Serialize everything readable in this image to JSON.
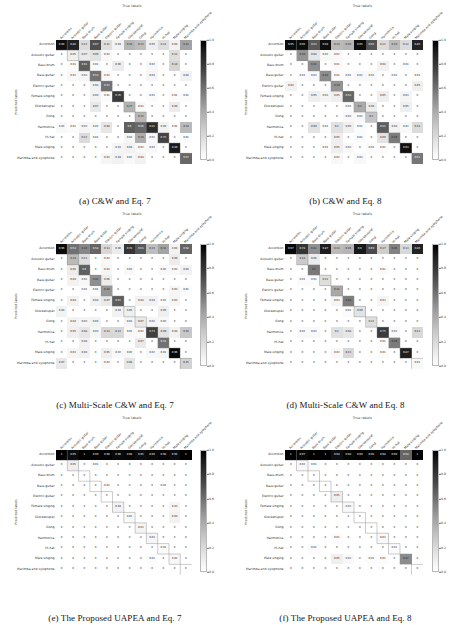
{
  "figure": {
    "axis_titles": {
      "x": "True labels",
      "y": "Predicted labels"
    },
    "classes": [
      "Accordion",
      "Acoustic guitar",
      "Bass drum",
      "Bass guitar",
      "Electric guitar",
      "Female singing",
      "Glockenspiel",
      "Gong",
      "Harmonica",
      "Hi-hat",
      "Male singing",
      "Marimba and xylophone"
    ],
    "colorbar": {
      "ticks": [
        "1.0",
        "0.8",
        "0.6",
        "0.4",
        "0.2",
        "0.0"
      ],
      "min": 0.0,
      "max": 1.0,
      "colormap": "greys"
    },
    "panels": [
      {
        "tag": "(a)",
        "caption": "(a) C&W and Eq. 7"
      },
      {
        "tag": "(b)",
        "caption": "(b) C&W and Eq. 8"
      },
      {
        "tag": "(c)",
        "caption": "(c) Multi-Scale C&W and Eq. 7"
      },
      {
        "tag": "(d)",
        "caption": "(d) Multi-Scale C&W and Eq. 8"
      },
      {
        "tag": "(e)",
        "caption": "(e) The Proposed UAPEA and Eq. 7"
      },
      {
        "tag": "(f)",
        "caption": "(f) The Proposed UAPEA and Eq. 8"
      }
    ]
  },
  "chart_data": [
    {
      "type": "heatmap",
      "title": "(a) C&W and Eq. 7",
      "xlabel": "True labels",
      "ylabel": "Predicted labels",
      "categories": [
        "Accordion",
        "Acoustic guitar",
        "Bass drum",
        "Bass guitar",
        "Electric guitar",
        "Female singing",
        "Glockenspiel",
        "Gong",
        "Harmonica",
        "Hi-hat",
        "Male singing",
        "Marimba and xylophone"
      ],
      "zlim": [
        0.0,
        1.0
      ],
      "values": [
        [
          0.94,
          0.86,
          0.12,
          0.67,
          0.11,
          0.04,
          0.26,
          0.23,
          0.05,
          0.11,
          0.04,
          0.33
        ],
        [
          0.0,
          0.05,
          0.07,
          0.09,
          0.02,
          0.0,
          0.0,
          0.0,
          0.0,
          0.0,
          0.11,
          0.0
        ],
        [
          0.0,
          0.01,
          0.61,
          0.01,
          0.0,
          0.06,
          0.0,
          0.0,
          0.02,
          0.0,
          0.14,
          0.0
        ],
        [
          0.0,
          0.02,
          0.03,
          0.53,
          0.02,
          0.0,
          0.0,
          0.0,
          0.03,
          0.0,
          0.0,
          0.04
        ],
        [
          0.0,
          0.0,
          0.0,
          0.04,
          0.53,
          0.0,
          0.0,
          0.0,
          0.0,
          0.0,
          0.0,
          0.0
        ],
        [
          0.0,
          0.0,
          0.0,
          0.04,
          0.01,
          0.76,
          0.0,
          0.0,
          0.01,
          0.0,
          0.01,
          0.01
        ],
        [
          0.0,
          0.0,
          0.0,
          0.07,
          0.0,
          0.0,
          0.27,
          0.02,
          0.0,
          0.0,
          0.06,
          0.0
        ],
        [
          0.0,
          0.0,
          0.0,
          0.0,
          0.0,
          0.0,
          0.0,
          0.25,
          0.0,
          0.0,
          0.0,
          0.0
        ],
        [
          0.02,
          0.01,
          0.03,
          0.02,
          0.08,
          0.0,
          0.6,
          0.56,
          0.81,
          0.04,
          0.01,
          0.24
        ],
        [
          0.0,
          0.0,
          0.12,
          0.01,
          0.0,
          0.0,
          0.03,
          0.29,
          0.02,
          0.72,
          0.0,
          0.01
        ],
        [
          0.0,
          0.0,
          0.0,
          0.0,
          0.0,
          0.03,
          0.04,
          0.02,
          0.02,
          0.0,
          0.89,
          0.0
        ],
        [
          0.0,
          0.0,
          0.0,
          0.0,
          0.03,
          0.04,
          0.02,
          0.04,
          0.0,
          0.0,
          0.0,
          0.57
        ]
      ]
    },
    {
      "type": "heatmap",
      "title": "(b) C&W and Eq. 8",
      "xlabel": "True labels",
      "ylabel": "Predicted labels",
      "categories": [
        "Accordion",
        "Acoustic guitar",
        "Bass drum",
        "Bass guitar",
        "Electric guitar",
        "Female singing",
        "Glockenspiel",
        "Gong",
        "Harmonica",
        "Hi-hat",
        "Male singing",
        "Marimba and xylophone"
      ],
      "zlim": [
        0.0,
        1.0
      ],
      "values": [
        [
          0.95,
          0.95,
          0.63,
          0.94,
          0.24,
          0.26,
          0.95,
          0.65,
          0.12,
          0.24,
          0.12,
          0.85
        ],
        [
          0.0,
          0.39,
          0.08,
          0.02,
          0.02,
          0.0,
          0.0,
          0.0,
          0.0,
          0.0,
          0.0,
          0.0
        ],
        [
          0.0,
          0.0,
          0.41,
          0.0,
          0.01,
          0.0,
          0.0,
          0.0,
          0.04,
          0.0,
          0.01,
          0.0
        ],
        [
          0.0,
          0.01,
          0.02,
          0.42,
          0.01,
          0.01,
          0.02,
          0.02,
          0.0,
          0.01,
          0.0,
          0.01
        ],
        [
          0.04,
          0.0,
          0.0,
          0.0,
          0.39,
          0.0,
          0.0,
          0.0,
          0.0,
          0.0,
          0.0,
          0.05
        ],
        [
          0.0,
          0.0,
          0.05,
          0.03,
          0.05,
          0.58,
          0.0,
          0.0,
          0.05,
          0.0,
          0.03,
          0.0
        ],
        [
          0.0,
          0.0,
          0.0,
          0.0,
          0.0,
          0.01,
          0.3,
          0.06,
          0.0,
          0.0,
          0.05,
          0.0
        ],
        [
          0.0,
          0.0,
          0.0,
          0.0,
          0.0,
          0.02,
          0.02,
          0.2,
          0.0,
          0.0,
          0.0,
          0.0
        ],
        [
          0.0,
          0.0,
          0.09,
          0.01,
          0.1,
          0.05,
          0.01,
          0.0,
          0.61,
          0.04,
          0.02,
          0.12
        ],
        [
          0.0,
          0.0,
          0.0,
          0.0,
          0.05,
          0.0,
          0.01,
          0.0,
          0.09,
          0.49,
          0.0,
          0.0
        ],
        [
          0.0,
          0.0,
          0.0,
          0.01,
          0.05,
          0.02,
          0.0,
          0.01,
          0.01,
          0.0,
          0.93,
          0.0
        ],
        [
          0.0,
          0.0,
          0.0,
          0.0,
          0.02,
          0.0,
          0.02,
          0.0,
          0.0,
          0.0,
          0.0,
          0.51
        ]
      ]
    },
    {
      "type": "heatmap",
      "title": "(c) Multi-Scale C&W and Eq. 7",
      "xlabel": "True labels",
      "ylabel": "Predicted labels",
      "categories": [
        "Accordion",
        "Acoustic guitar",
        "Bass drum",
        "Bass guitar",
        "Electric guitar",
        "Female singing",
        "Glockenspiel",
        "Gong",
        "Harmonica",
        "Hi-hat",
        "Male singing",
        "Marimba and xylophone"
      ],
      "zlim": [
        0.0,
        1.0
      ],
      "values": [
        [
          0.96,
          0.53,
          0.44,
          0.58,
          0.13,
          0.06,
          0.78,
          0.63,
          0.23,
          0.33,
          0.04,
          0.58
        ],
        [
          0.0,
          0.24,
          0.11,
          0.0,
          0.02,
          0.0,
          0.0,
          0.0,
          0.0,
          0.0,
          0.06,
          0.0
        ],
        [
          0.0,
          0.06,
          0.6,
          0.0,
          0.03,
          0.0,
          0.02,
          0.0,
          0.0,
          0.02,
          0.02,
          0.04
        ],
        [
          0.0,
          0.04,
          0.02,
          0.41,
          0.06,
          0.0,
          0.0,
          0.0,
          0.0,
          0.0,
          0.0,
          0.0
        ],
        [
          0.0,
          0.0,
          0.01,
          0.01,
          0.38,
          0.0,
          0.0,
          0.0,
          0.0,
          0.0,
          0.03,
          0.01
        ],
        [
          0.0,
          0.04,
          0.0,
          0.04,
          0.07,
          0.61,
          0.0,
          0.04,
          0.04,
          0.01,
          0.03,
          0.0
        ],
        [
          0.04,
          0.0,
          0.0,
          0.0,
          0.0,
          0.04,
          0.05,
          0.0,
          0.0,
          0.05,
          0.0,
          0.0
        ],
        [
          0.0,
          0.04,
          0.03,
          0.04,
          0.0,
          0.0,
          0.03,
          0.07,
          0.03,
          0.02,
          0.0,
          0.0
        ],
        [
          0.0,
          0.05,
          0.08,
          0.03,
          0.13,
          0.13,
          0.02,
          0.02,
          0.73,
          0.09,
          0.04,
          0.19
        ],
        [
          0.0,
          0.0,
          0.04,
          0.0,
          0.0,
          0.0,
          0.0,
          0.07,
          0.0,
          0.53,
          0.0,
          0.0
        ],
        [
          0.0,
          0.03,
          0.04,
          0.0,
          0.05,
          0.02,
          0.02,
          0.0,
          0.02,
          0.03,
          0.96,
          0.0
        ],
        [
          0.07,
          0.0,
          0.0,
          0.0,
          0.02,
          0.0,
          0.08,
          0.0,
          0.0,
          0.0,
          0.0,
          0.15
        ]
      ]
    },
    {
      "type": "heatmap",
      "title": "(d) Multi-Scale C&W and Eq. 8",
      "xlabel": "True labels",
      "ylabel": "Predicted labels",
      "categories": [
        "Accordion",
        "Acoustic guitar",
        "Bass drum",
        "Bass guitar",
        "Electric guitar",
        "Female singing",
        "Glockenspiel",
        "Gong",
        "Harmonica",
        "Hi-hat",
        "Male singing",
        "Marimba and xylophone"
      ],
      "zlim": [
        0.0,
        1.0
      ],
      "values": [
        [
          0.97,
          0.78,
          0.41,
          0.87,
          0.24,
          0.26,
          0.9,
          0.69,
          0.17,
          0.46,
          0.13,
          0.85
        ],
        [
          0.0,
          0.18,
          0.06,
          0.0,
          0.0,
          0.0,
          0.0,
          0.0,
          0.0,
          0.0,
          0.0,
          0.0
        ],
        [
          0.0,
          0.0,
          0.5,
          0.0,
          0.0,
          0.0,
          0.0,
          0.0,
          0.01,
          0.0,
          0.0,
          0.0
        ],
        [
          0.0,
          0.01,
          0.01,
          0.11,
          0.0,
          0.0,
          0.0,
          0.0,
          0.0,
          0.0,
          0.0,
          0.0
        ],
        [
          0.0,
          0.0,
          0.0,
          0.0,
          0.31,
          0.0,
          0.0,
          0.0,
          0.0,
          0.0,
          0.0,
          0.0
        ],
        [
          0.0,
          0.0,
          0.0,
          0.0,
          0.03,
          0.48,
          0.0,
          0.0,
          0.03,
          0.0,
          0.0,
          0.0
        ],
        [
          0.0,
          0.0,
          0.0,
          0.0,
          0.0,
          0.01,
          0.09,
          0.0,
          0.0,
          0.0,
          0.0,
          0.0
        ],
        [
          0.0,
          0.0,
          0.0,
          0.0,
          0.0,
          0.0,
          0.0,
          0.11,
          0.0,
          0.0,
          0.0,
          0.0
        ],
        [
          0.0,
          0.02,
          0.02,
          0.0,
          0.1,
          0.08,
          0.0,
          0.0,
          0.75,
          0.02,
          0.0,
          0.13
        ],
        [
          0.0,
          0.0,
          0.0,
          0.0,
          0.0,
          0.0,
          0.0,
          0.0,
          0.01,
          0.49,
          0.0,
          0.0
        ],
        [
          0.0,
          0.0,
          0.0,
          0.0,
          0.02,
          0.13,
          0.0,
          0.0,
          0.01,
          0.0,
          0.87,
          0.0
        ],
        [
          0.0,
          0.0,
          0.0,
          0.0,
          0.0,
          0.0,
          0.0,
          0.0,
          0.0,
          0.0,
          0.0,
          0.02
        ]
      ]
    },
    {
      "type": "heatmap",
      "title": "(e) The Proposed UAPEA and Eq. 7",
      "xlabel": "True labels",
      "ylabel": "Predicted labels",
      "categories": [
        "Accordion",
        "Acoustic guitar",
        "Bass drum",
        "Bass guitar",
        "Electric guitar",
        "Female singing",
        "Glockenspiel",
        "Gong",
        "Harmonica",
        "Hi-hat",
        "Male singing",
        "Marimba and xylophone"
      ],
      "zlim": [
        0.0,
        1.0
      ],
      "values": [
        [
          1.0,
          0.95,
          1.0,
          0.99,
          0.99,
          0.96,
          0.98,
          0.95,
          0.96,
          0.98,
          0.95,
          1.0
        ],
        [
          0.0,
          0.05,
          0.0,
          0.01,
          0.0,
          0.0,
          0.0,
          0.0,
          0.0,
          0.0,
          0.0,
          0.0
        ],
        [
          0.0,
          0.0,
          0.0,
          0.0,
          0.0,
          0.0,
          0.0,
          0.0,
          0.0,
          0.0,
          0.0,
          0.0
        ],
        [
          0.0,
          0.0,
          0.0,
          0.0,
          0.01,
          0.0,
          0.0,
          0.0,
          0.0,
          0.01,
          0.0,
          0.0
        ],
        [
          0.0,
          0.0,
          0.0,
          0.0,
          0.0,
          0.0,
          0.0,
          0.0,
          0.0,
          0.0,
          0.0,
          0.0
        ],
        [
          0.0,
          0.0,
          0.0,
          0.0,
          0.0,
          0.04,
          0.0,
          0.0,
          0.0,
          0.0,
          0.03,
          0.0
        ],
        [
          0.0,
          0.0,
          0.0,
          0.0,
          0.0,
          0.0,
          0.02,
          0.0,
          0.0,
          0.0,
          0.04,
          0.0
        ],
        [
          0.0,
          0.0,
          0.0,
          0.0,
          0.0,
          0.0,
          0.0,
          0.03,
          0.0,
          0.0,
          0.0,
          0.0
        ],
        [
          0.0,
          0.0,
          0.0,
          0.0,
          0.0,
          0.0,
          0.0,
          0.0,
          0.03,
          0.0,
          0.0,
          0.0
        ],
        [
          0.0,
          0.0,
          0.0,
          0.0,
          0.0,
          0.0,
          0.0,
          0.0,
          0.0,
          0.01,
          0.0,
          0.0
        ],
        [
          0.0,
          0.0,
          0.0,
          0.0,
          0.0,
          0.0,
          0.0,
          0.0,
          0.01,
          0.0,
          0.02,
          0.0
        ],
        [
          0.0,
          0.0,
          0.0,
          0.0,
          0.0,
          0.0,
          0.0,
          0.0,
          0.0,
          0.0,
          0.0,
          0.0
        ]
      ]
    },
    {
      "type": "heatmap",
      "title": "(f) The Proposed UAPEA and Eq. 8",
      "xlabel": "True labels",
      "ylabel": "Predicted labels",
      "categories": [
        "Accordion",
        "Acoustic guitar",
        "Bass drum",
        "Bass guitar",
        "Electric guitar",
        "Female singing",
        "Glockenspiel",
        "Gong",
        "Harmonica",
        "Hi-hat",
        "Male singing",
        "Marimba and xylophone"
      ],
      "zlim": [
        0.0,
        1.0
      ],
      "values": [
        [
          1.0,
          0.97,
          1.0,
          1.0,
          0.94,
          0.98,
          0.99,
          0.98,
          0.98,
          0.99,
          0.58,
          1.0
        ],
        [
          0.0,
          0.02,
          0.01,
          0.0,
          0.0,
          0.0,
          0.0,
          0.0,
          0.0,
          0.0,
          0.0,
          0.0
        ],
        [
          0.0,
          0.0,
          0.0,
          0.0,
          0.0,
          0.0,
          0.0,
          0.0,
          0.0,
          0.0,
          0.0,
          0.0
        ],
        [
          0.0,
          0.0,
          0.0,
          0.0,
          0.0,
          0.0,
          0.0,
          0.0,
          0.0,
          0.0,
          0.0,
          0.0
        ],
        [
          0.0,
          0.0,
          0.0,
          0.0,
          0.05,
          0.0,
          0.0,
          0.0,
          0.0,
          0.0,
          0.0,
          0.0
        ],
        [
          0.0,
          0.0,
          0.0,
          0.0,
          0.0,
          0.02,
          0.0,
          0.0,
          0.0,
          0.0,
          0.0,
          0.0
        ],
        [
          0.0,
          0.0,
          0.0,
          0.0,
          0.0,
          0.0,
          0.0,
          0.0,
          0.0,
          0.0,
          0.0,
          0.0
        ],
        [
          0.0,
          0.0,
          0.0,
          0.0,
          0.0,
          0.0,
          0.0,
          0.0,
          0.0,
          0.0,
          0.0,
          0.0
        ],
        [
          0.0,
          0.0,
          0.0,
          0.0,
          0.01,
          0.0,
          0.0,
          0.0,
          0.02,
          0.0,
          0.0,
          0.0
        ],
        [
          0.0,
          0.0,
          0.01,
          0.0,
          0.0,
          0.0,
          0.0,
          0.0,
          0.0,
          0.01,
          0.0,
          0.0
        ],
        [
          0.0,
          0.0,
          0.0,
          0.0,
          0.05,
          0.02,
          0.0,
          0.01,
          0.01,
          0.0,
          0.42,
          0.0
        ],
        [
          0.0,
          0.0,
          0.0,
          0.0,
          0.0,
          0.0,
          0.0,
          0.0,
          0.0,
          0.0,
          0.0,
          0.0
        ]
      ]
    }
  ]
}
